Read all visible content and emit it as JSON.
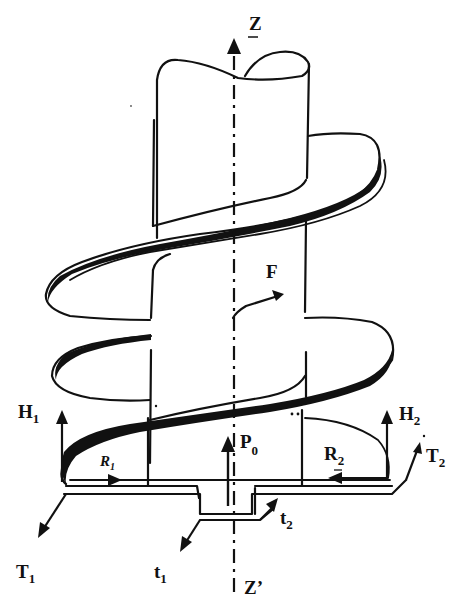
{
  "figure": {
    "background": "#ffffff",
    "ink": "#111111"
  },
  "labels": {
    "axis_top": "Z",
    "axis_bottom": "Z’",
    "force_F": "F",
    "axial_load": {
      "main": "P",
      "sub": "0"
    },
    "H1": {
      "main": "H",
      "sub": "1"
    },
    "H2": {
      "main": "H",
      "sub": "2"
    },
    "R1": {
      "main": "R",
      "sub": "1"
    },
    "R2": {
      "main": "R",
      "sub": "2"
    },
    "T1": {
      "main": "T",
      "sub": "1"
    },
    "T2": {
      "main": "T",
      "sub": "2"
    },
    "t1": {
      "main": "t",
      "sub": "1"
    },
    "t2": {
      "main": "t",
      "sub": "2"
    }
  }
}
